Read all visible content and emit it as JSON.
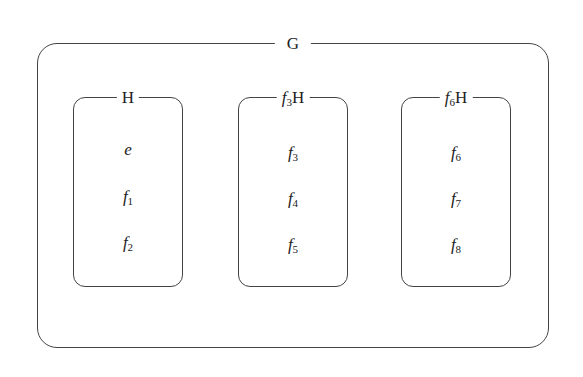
{
  "diagram": {
    "type": "set-partition / coset diagram",
    "outer": {
      "label": "G"
    },
    "cosets": [
      {
        "label_prefix": "",
        "label_prefix_sub": "",
        "label_suffix": "H",
        "elements": [
          {
            "base": "e",
            "sub": ""
          },
          {
            "base": "f",
            "sub": "1"
          },
          {
            "base": "f",
            "sub": "2"
          }
        ]
      },
      {
        "label_prefix": "f",
        "label_prefix_sub": "3",
        "label_suffix": "H",
        "elements": [
          {
            "base": "f",
            "sub": "3"
          },
          {
            "base": "f",
            "sub": "4"
          },
          {
            "base": "f",
            "sub": "5"
          }
        ]
      },
      {
        "label_prefix": "f",
        "label_prefix_sub": "6",
        "label_suffix": "H",
        "elements": [
          {
            "base": "f",
            "sub": "6"
          },
          {
            "base": "f",
            "sub": "7"
          },
          {
            "base": "f",
            "sub": "8"
          }
        ]
      }
    ]
  }
}
